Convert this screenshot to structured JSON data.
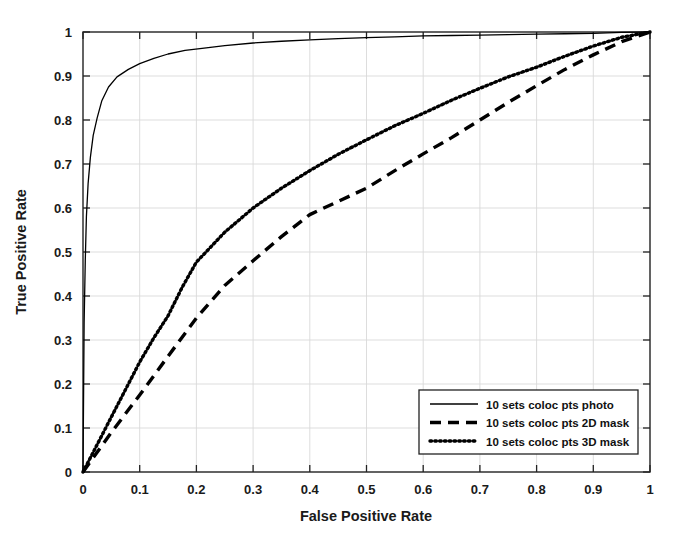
{
  "chart_data": {
    "type": "line",
    "title": "",
    "xlabel": "False Positive Rate",
    "ylabel": "True Positive Rate",
    "xlim": [
      0,
      1
    ],
    "ylim": [
      0,
      1
    ],
    "grid": true,
    "legend_position": "bottom-right",
    "xticks": [
      "0",
      "0.1",
      "0.2",
      "0.3",
      "0.4",
      "0.5",
      "0.6",
      "0.7",
      "0.8",
      "0.9",
      "1"
    ],
    "yticks": [
      "0",
      "0.1",
      "0.2",
      "0.3",
      "0.4",
      "0.5",
      "0.6",
      "0.7",
      "0.8",
      "0.9",
      "1"
    ],
    "xtick_values": [
      0,
      0.1,
      0.2,
      0.3,
      0.4,
      0.5,
      0.6,
      0.7,
      0.8,
      0.9,
      1
    ],
    "ytick_values": [
      0,
      0.1,
      0.2,
      0.3,
      0.4,
      0.5,
      0.6,
      0.7,
      0.8,
      0.9,
      1
    ],
    "series": [
      {
        "name": "10 sets coloc pts photo",
        "style": "solid",
        "color": "#000000",
        "x": [
          0,
          0.002,
          0.004,
          0.006,
          0.009,
          0.013,
          0.018,
          0.025,
          0.033,
          0.045,
          0.06,
          0.08,
          0.1,
          0.125,
          0.15,
          0.18,
          0.21,
          0.25,
          0.3,
          0.35,
          0.4,
          0.45,
          0.5,
          0.55,
          0.6,
          0.65,
          0.7,
          0.75,
          0.8,
          0.85,
          0.9,
          0.95,
          1.0
        ],
        "y": [
          0,
          0.34,
          0.48,
          0.58,
          0.655,
          0.715,
          0.765,
          0.805,
          0.843,
          0.875,
          0.898,
          0.915,
          0.928,
          0.94,
          0.95,
          0.958,
          0.963,
          0.969,
          0.975,
          0.979,
          0.982,
          0.985,
          0.987,
          0.989,
          0.991,
          0.992,
          0.993,
          0.994,
          0.995,
          0.996,
          0.997,
          0.999,
          1.0
        ]
      },
      {
        "name": "10 sets coloc pts 2D mask",
        "style": "dashed",
        "color": "#000000",
        "x": [
          0,
          0.05,
          0.1,
          0.15,
          0.2,
          0.25,
          0.3,
          0.35,
          0.4,
          0.45,
          0.5,
          0.55,
          0.6,
          0.65,
          0.7,
          0.75,
          0.8,
          0.85,
          0.9,
          0.95,
          1.0
        ],
        "y": [
          0,
          0.09,
          0.175,
          0.263,
          0.35,
          0.424,
          0.48,
          0.535,
          0.585,
          0.615,
          0.645,
          0.685,
          0.723,
          0.76,
          0.8,
          0.84,
          0.878,
          0.915,
          0.948,
          0.978,
          1.0
        ]
      },
      {
        "name": "10 sets coloc pts 3D mask",
        "style": "dotted",
        "color": "#000000",
        "x": [
          0,
          0.05,
          0.1,
          0.125,
          0.15,
          0.175,
          0.2,
          0.25,
          0.3,
          0.35,
          0.4,
          0.45,
          0.5,
          0.55,
          0.6,
          0.65,
          0.7,
          0.75,
          0.8,
          0.85,
          0.9,
          0.95,
          1.0
        ],
        "y": [
          0,
          0.125,
          0.25,
          0.305,
          0.355,
          0.42,
          0.477,
          0.545,
          0.6,
          0.645,
          0.685,
          0.722,
          0.755,
          0.787,
          0.815,
          0.845,
          0.872,
          0.898,
          0.92,
          0.945,
          0.968,
          0.988,
          1.0
        ]
      }
    ]
  },
  "legend": {
    "entries": [
      {
        "label": "10 sets coloc pts photo",
        "style": "solid"
      },
      {
        "label": "10 sets coloc pts 2D mask",
        "style": "dashed"
      },
      {
        "label": "10 sets coloc pts 3D mask",
        "style": "dotted"
      }
    ]
  }
}
